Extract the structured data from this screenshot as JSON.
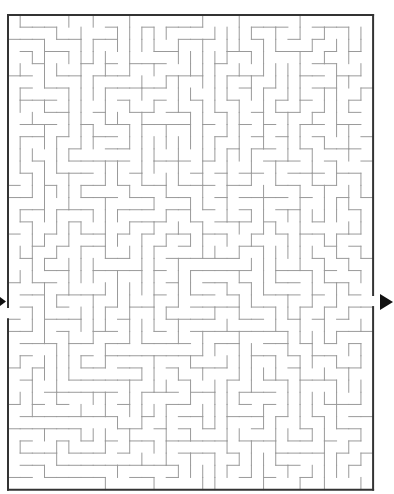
{
  "puzzle": {
    "type": "maze",
    "entrance_label": "start",
    "exit_label": "finish",
    "colors": {
      "wall": "#9a9a9a",
      "border": "#333333",
      "arrow": "#111111",
      "background": "#ffffff"
    },
    "grid": {
      "cols": 30,
      "rows": 39,
      "cell": 12.17,
      "origin_x": 8,
      "origin_y": 15
    },
    "openings": {
      "left_row": 24,
      "right_row": 23
    },
    "seed": 1337
  }
}
